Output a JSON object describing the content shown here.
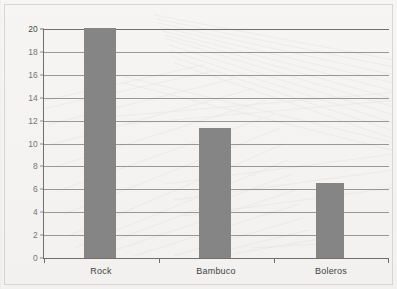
{
  "chart_data": {
    "type": "bar",
    "title": "",
    "subtitle": "",
    "xlabel": "",
    "ylabel": "",
    "categories": [
      "Rock",
      "Bambuco",
      "Boleros"
    ],
    "values": [
      20,
      11.3,
      6.5
    ],
    "series": [
      {
        "name": "",
        "values": [
          20,
          11.3,
          6.5
        ]
      }
    ],
    "ylim": [
      0,
      20
    ],
    "xlim": [
      0,
      3
    ],
    "ytick_labels": [
      "0",
      "2",
      "4",
      "6",
      "8",
      "10",
      "12",
      "14",
      "16",
      "18",
      "20"
    ],
    "ytick_values": [
      0,
      2,
      4,
      6,
      8,
      10,
      12,
      14,
      16,
      18,
      20
    ],
    "ytick_step": 2,
    "grid": "horizontal",
    "legend": "none",
    "annotations": [],
    "bar_color": "#858585",
    "axis_color": "#6e6e6e",
    "grid_color": "#7a7a7a",
    "background_color": "#f4f3f1",
    "frame_color": "#d8d6d2"
  }
}
